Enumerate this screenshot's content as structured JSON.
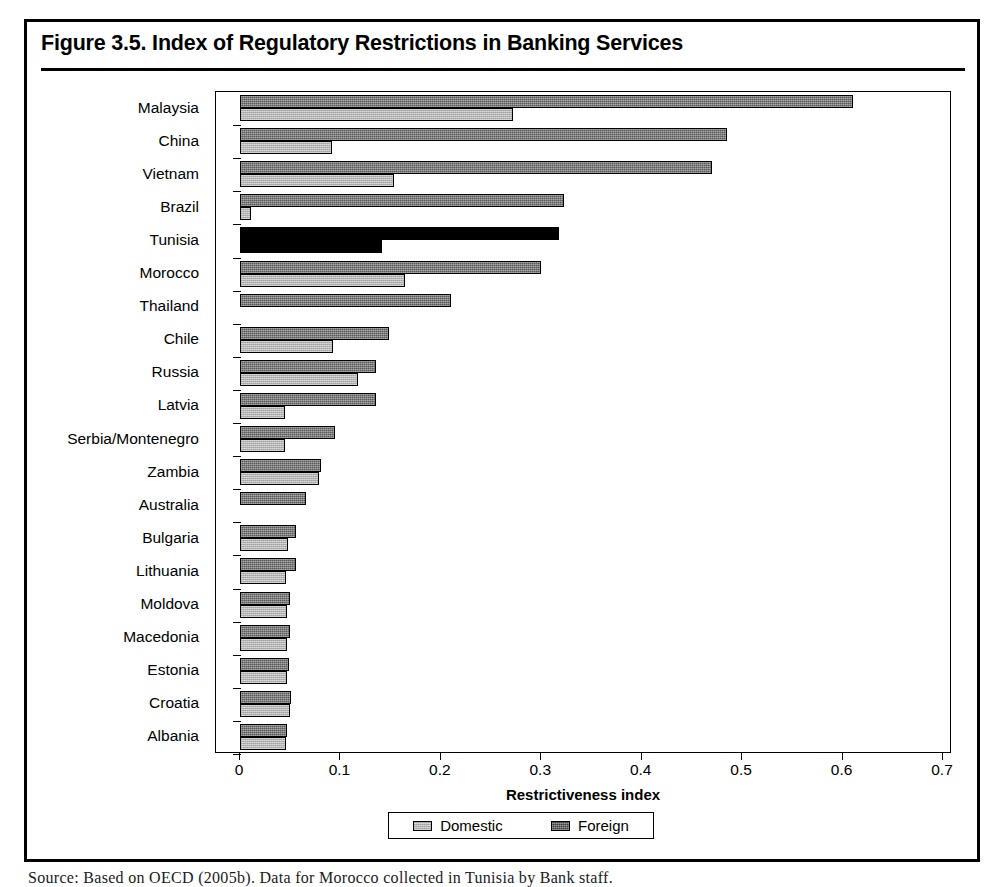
{
  "figure": {
    "title": "Figure 3.5.  Index of Regulatory Restrictions in Banking Services",
    "source_note": "Source:  Based on OECD (2005b). Data for Morocco collected in Tunisia by Bank staff."
  },
  "legend": {
    "domestic_label": "Domestic",
    "foreign_label": "Foreign",
    "domestic_color": "#b4b4b4",
    "foreign_color": "#3d3d3d",
    "highlight_color": "#000000"
  },
  "axis": {
    "x_title": "Restrictiveness index",
    "x_ticks": [
      "0",
      "0.1",
      "0.2",
      "0.3",
      "0.4",
      "0.5",
      "0.6",
      "0.7"
    ],
    "x_min": 0,
    "x_max": 0.7
  },
  "chart_data": {
    "type": "bar",
    "orientation": "horizontal",
    "title": "Figure 3.5.  Index of Regulatory Restrictions in Banking Services",
    "xlabel": "Restrictiveness index",
    "ylabel": "",
    "xlim": [
      0,
      0.7
    ],
    "grid": false,
    "legend_position": "bottom",
    "highlight_category": "Tunisia",
    "categories": [
      "Malaysia",
      "China",
      "Vietnam",
      "Brazil",
      "Tunisia",
      "Morocco",
      "Thailand",
      "Chile",
      "Russia",
      "Latvia",
      "Serbia/Montenegro",
      "Zambia",
      "Australia",
      "Bulgaria",
      "Lithuania",
      "Moldova",
      "Macedonia",
      "Estonia",
      "Croatia",
      "Albania"
    ],
    "series": [
      {
        "name": "Foreign",
        "values": [
          0.61,
          0.485,
          0.47,
          0.323,
          0.318,
          0.3,
          0.21,
          0.148,
          0.135,
          0.135,
          0.095,
          0.081,
          0.066,
          0.056,
          0.056,
          0.05,
          0.05,
          0.049,
          0.051,
          0.047
        ]
      },
      {
        "name": "Domestic",
        "values": [
          0.272,
          0.092,
          0.153,
          0.011,
          0.141,
          0.164,
          0.0,
          0.093,
          0.117,
          0.045,
          0.045,
          0.079,
          0.0,
          0.048,
          0.046,
          0.047,
          0.047,
          0.047,
          0.05,
          0.046
        ]
      }
    ]
  }
}
